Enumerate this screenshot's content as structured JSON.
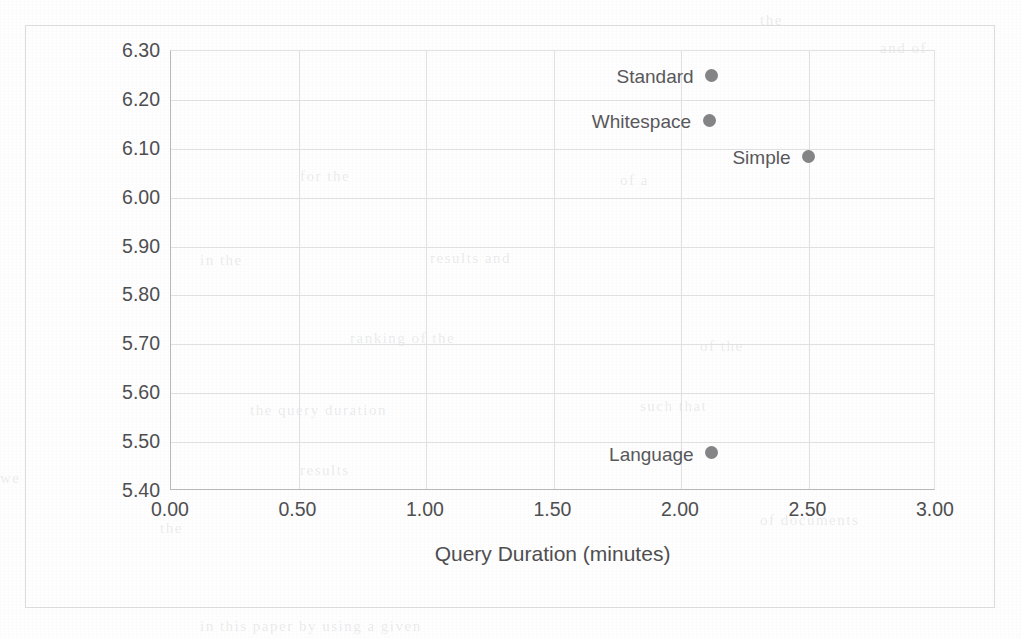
{
  "chart_data": {
    "type": "scatter",
    "title": "",
    "xlabel": "Query Duration (minutes)",
    "ylabel": "Top Scoring Document",
    "xlim": [
      0.0,
      3.0
    ],
    "ylim": [
      5.4,
      6.3
    ],
    "xticks": [
      "0.00",
      "0.50",
      "1.00",
      "1.50",
      "2.00",
      "2.50",
      "3.00"
    ],
    "xtick_values": [
      0.0,
      0.5,
      1.0,
      1.5,
      2.0,
      2.5,
      3.0
    ],
    "yticks": [
      "5.40",
      "5.50",
      "5.60",
      "5.70",
      "5.80",
      "5.90",
      "6.00",
      "6.10",
      "6.20",
      "6.30"
    ],
    "ytick_values": [
      5.4,
      5.5,
      5.6,
      5.7,
      5.8,
      5.9,
      6.0,
      6.1,
      6.2,
      6.3
    ],
    "grid": "both",
    "legend_position": "none",
    "marker_color": "#848487",
    "points": [
      {
        "label": "Standard",
        "x": 2.12,
        "y": 6.25
      },
      {
        "label": "Whitespace",
        "x": 2.11,
        "y": 6.158
      },
      {
        "label": "Simple",
        "x": 2.5,
        "y": 6.085
      },
      {
        "label": "Language",
        "x": 2.12,
        "y": 5.478
      }
    ]
  },
  "ghost_lines": [
    {
      "text": "the",
      "x": 760,
      "y": 12
    },
    {
      "text": "and of",
      "x": 880,
      "y": 40
    },
    {
      "text": "for the",
      "x": 300,
      "y": 168
    },
    {
      "text": "of a",
      "x": 620,
      "y": 172
    },
    {
      "text": "in the",
      "x": 200,
      "y": 252
    },
    {
      "text": "results and",
      "x": 430,
      "y": 250
    },
    {
      "text": "ranking of the",
      "x": 350,
      "y": 330
    },
    {
      "text": "of the",
      "x": 700,
      "y": 338
    },
    {
      "text": "the query duration",
      "x": 250,
      "y": 402
    },
    {
      "text": "such that",
      "x": 640,
      "y": 398
    },
    {
      "text": "results",
      "x": 300,
      "y": 462
    },
    {
      "text": "we",
      "x": 0,
      "y": 470
    },
    {
      "text": "the",
      "x": 160,
      "y": 520
    },
    {
      "text": "of documents",
      "x": 760,
      "y": 512
    },
    {
      "text": "in this paper by using a given",
      "x": 200,
      "y": 618
    }
  ]
}
